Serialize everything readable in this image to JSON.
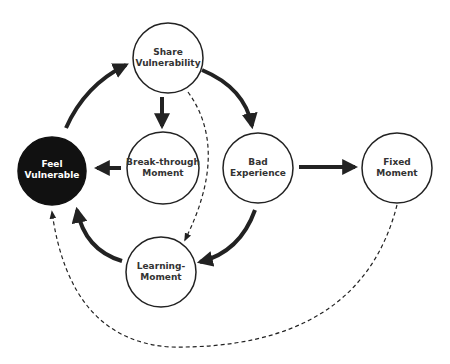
{
  "diagram": {
    "colors": {
      "stroke": "#222222",
      "dark_node_fill": "#111111",
      "dark_node_text": "#ffffff",
      "light_node_text": "#333333",
      "background": "#ffffff"
    },
    "nodes": [
      {
        "id": "share",
        "line1": "Share",
        "line2": "Vulnerability"
      },
      {
        "id": "feel",
        "line1": "Feel",
        "line2": "Vulnerable"
      },
      {
        "id": "breakthrough",
        "line1": "Break-through",
        "line2": "Moment"
      },
      {
        "id": "bad",
        "line1": "Bad",
        "line2": "Experience"
      },
      {
        "id": "fixed",
        "line1": "Fixed",
        "line2": "Moment"
      },
      {
        "id": "learning",
        "line1": "Learning-",
        "line2": "Moment"
      }
    ],
    "edges": [
      {
        "from": "Feel Vulnerable",
        "to": "Share Vulnerability",
        "style": "solid"
      },
      {
        "from": "Share Vulnerability",
        "to": "Break-through Moment",
        "style": "solid"
      },
      {
        "from": "Share Vulnerability",
        "to": "Bad Experience",
        "style": "solid"
      },
      {
        "from": "Share Vulnerability",
        "to": "Learning-Moment",
        "style": "dashed"
      },
      {
        "from": "Break-through Moment",
        "to": "Feel Vulnerable",
        "style": "solid"
      },
      {
        "from": "Bad Experience",
        "to": "Fixed Moment",
        "style": "solid"
      },
      {
        "from": "Bad Experience",
        "to": "Learning-Moment",
        "style": "solid"
      },
      {
        "from": "Learning-Moment",
        "to": "Feel Vulnerable",
        "style": "solid"
      },
      {
        "from": "Fixed Moment",
        "to": "Feel Vulnerable",
        "style": "dashed"
      }
    ]
  }
}
